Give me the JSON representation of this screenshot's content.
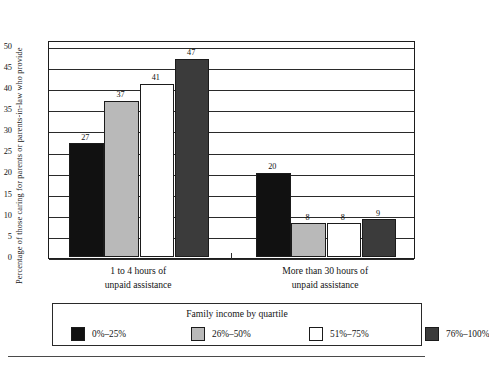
{
  "chart_data": {
    "type": "bar",
    "title": "",
    "xlabel": "",
    "ylabel": "Percentage of those caring for parents or parents-in-law who provide",
    "ylim": [
      0,
      50
    ],
    "yticks": [
      0,
      5,
      10,
      15,
      20,
      25,
      30,
      35,
      40,
      45,
      50
    ],
    "grid": true,
    "legend_position": "bottom",
    "legend_title": "Family income by quartile",
    "categories": [
      "1 to 4 hours of unpaid assistance",
      "More than 30 hours of unpaid assistance"
    ],
    "category_lines": [
      [
        "1 to 4 hours of",
        "unpaid assistance"
      ],
      [
        "More than 30 hours of",
        "unpaid assistance"
      ]
    ],
    "series": [
      {
        "name": "0%–25%",
        "color": "#111111",
        "values": [
          27,
          20
        ]
      },
      {
        "name": "26%–50%",
        "color": "#b9b9b9",
        "values": [
          37,
          8
        ]
      },
      {
        "name": "51%–75%",
        "color": "#ffffff",
        "values": [
          41,
          8
        ]
      },
      {
        "name": "76%–100%",
        "color": "#3b3b3b",
        "values": [
          47,
          9
        ]
      }
    ]
  },
  "axis": {
    "tick_labels": [
      "50",
      "45",
      "40",
      "35",
      "30",
      "25",
      "20",
      "15",
      "10",
      "5",
      "0"
    ]
  },
  "bar_labels": {
    "group1": [
      "27",
      "37",
      "41",
      "47"
    ],
    "group2": [
      "20",
      "8",
      "8",
      "9"
    ]
  },
  "legend": {
    "title": "Family income by quartile",
    "items": [
      {
        "label": "0%–25%",
        "color": "#111111"
      },
      {
        "label": "26%–50%",
        "color": "#b9b9b9"
      },
      {
        "label": "51%–75%",
        "color": "#ffffff"
      },
      {
        "label": "76%–100%",
        "color": "#3b3b3b"
      }
    ]
  }
}
